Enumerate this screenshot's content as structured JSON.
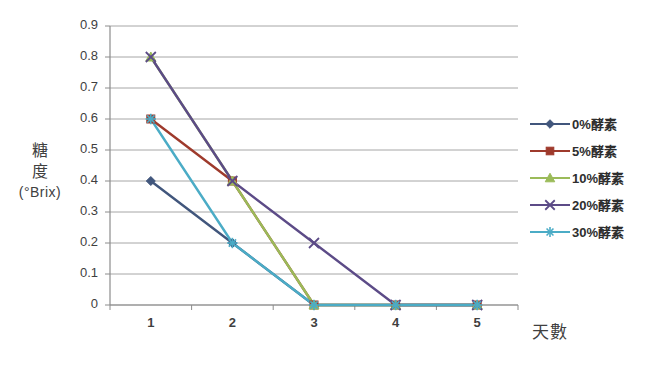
{
  "chart_data": {
    "type": "line",
    "title": "",
    "subtitle": "",
    "xlabel": "天數",
    "ylabel": "糖度 (°Brix)",
    "ylabel_lines": [
      "糖",
      "度",
      "(°Brix)"
    ],
    "categories": [
      "1",
      "2",
      "3",
      "4",
      "5"
    ],
    "x": [
      1,
      2,
      3,
      4,
      5
    ],
    "ylim": [
      0,
      0.9
    ],
    "xlim": [
      0.5,
      5.5
    ],
    "ytick_labels": [
      "0.9",
      "0.8",
      "0.7",
      "0.6",
      "0.5",
      "0.4",
      "0.3",
      "0.2",
      "0.1",
      "0"
    ],
    "ytick_values": [
      0.9,
      0.8,
      0.7,
      0.6,
      0.5,
      0.4,
      0.3,
      0.2,
      0.1,
      0
    ],
    "grid": true,
    "grid_axis": "y",
    "legend_position": "right",
    "series": [
      {
        "name": "0%酵素",
        "values": [
          0.4,
          0.2,
          0,
          0,
          0
        ],
        "color": "#41567C",
        "marker": "diamond"
      },
      {
        "name": "5%酵素",
        "values": [
          0.6,
          0.4,
          0,
          0,
          0
        ],
        "color": "#9E3A2C",
        "marker": "square"
      },
      {
        "name": "10%酵素",
        "values": [
          0.8,
          0.4,
          0,
          0,
          0
        ],
        "color": "#9BBB59",
        "marker": "triangle"
      },
      {
        "name": "20%酵素",
        "values": [
          0.8,
          0.4,
          0.2,
          0,
          0
        ],
        "color": "#5C4B87",
        "marker": "x"
      },
      {
        "name": "30%酵素",
        "values": [
          0.6,
          0.2,
          0,
          0,
          0
        ],
        "color": "#4BACC6",
        "marker": "asterisk"
      }
    ]
  },
  "colors": {
    "grid": "#a6a6a6",
    "axis": "#8c8c8c",
    "text": "#3f3f3f",
    "background": "#ffffff"
  }
}
